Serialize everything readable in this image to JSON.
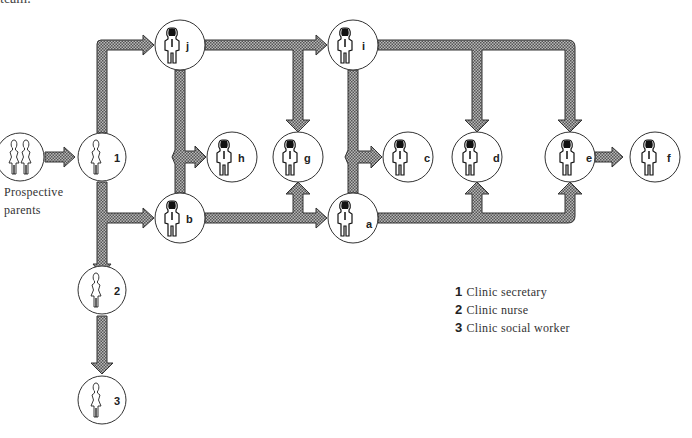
{
  "header": {
    "cut_text": "team."
  },
  "diagram": {
    "start_label_line1": "Prospective",
    "start_label_line2": "parents",
    "nodes": [
      {
        "id": "parents",
        "label": "",
        "figure": "couple"
      },
      {
        "id": "1",
        "label": "1",
        "figure": "woman-outline"
      },
      {
        "id": "2",
        "label": "2",
        "figure": "woman-outline"
      },
      {
        "id": "3",
        "label": "3",
        "figure": "woman-outline"
      },
      {
        "id": "j",
        "label": "j",
        "figure": "man"
      },
      {
        "id": "b",
        "label": "b",
        "figure": "man"
      },
      {
        "id": "h",
        "label": "h",
        "figure": "man"
      },
      {
        "id": "g",
        "label": "g",
        "figure": "man"
      },
      {
        "id": "i",
        "label": "i",
        "figure": "man"
      },
      {
        "id": "a",
        "label": "a",
        "figure": "man"
      },
      {
        "id": "c",
        "label": "c",
        "figure": "man"
      },
      {
        "id": "d",
        "label": "d",
        "figure": "man"
      },
      {
        "id": "e",
        "label": "e",
        "figure": "man"
      },
      {
        "id": "f",
        "label": "f",
        "figure": "man"
      }
    ],
    "edges": [
      [
        "parents",
        "1"
      ],
      [
        "1",
        "j"
      ],
      [
        "1",
        "b"
      ],
      [
        "1",
        "2"
      ],
      [
        "2",
        "3"
      ],
      [
        "j",
        "i"
      ],
      [
        "j",
        "g"
      ],
      [
        "j",
        "h"
      ],
      [
        "b",
        "h"
      ],
      [
        "b",
        "g"
      ],
      [
        "b",
        "a"
      ],
      [
        "i",
        "d"
      ],
      [
        "i",
        "e"
      ],
      [
        "i",
        "c"
      ],
      [
        "a",
        "c"
      ],
      [
        "a",
        "d"
      ],
      [
        "a",
        "e"
      ],
      [
        "e",
        "f"
      ]
    ],
    "arrow_fill": "#9a9a9a",
    "arrow_stroke": "#333333"
  },
  "legend": {
    "items": [
      {
        "num": "1",
        "text": "Clinic secretary"
      },
      {
        "num": "2",
        "text": "Clinic nurse"
      },
      {
        "num": "3",
        "text": "Clinic social worker"
      }
    ]
  }
}
